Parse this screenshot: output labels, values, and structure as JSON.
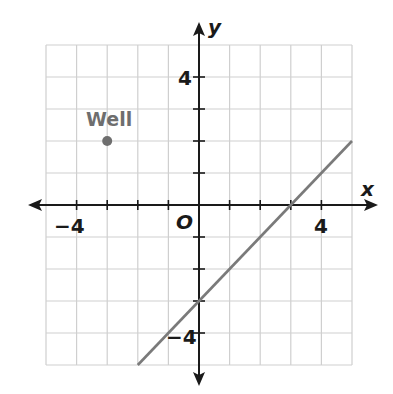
{
  "chart_data": {
    "type": "line",
    "title": "",
    "xlabel": "x",
    "ylabel": "y",
    "xlim": [
      -5,
      5
    ],
    "ylim": [
      -5,
      5
    ],
    "grid": true,
    "x_tick_labels": [
      {
        "value": -4,
        "label": "−4"
      },
      {
        "value": 4,
        "label": "4"
      }
    ],
    "y_tick_labels": [
      {
        "value": 4,
        "label": "4"
      },
      {
        "value": -4,
        "label": "−4"
      }
    ],
    "origin_label": "O",
    "series": [
      {
        "name": "line",
        "type": "line",
        "equation": "y = x - 3",
        "points": [
          [
            -2,
            -5
          ],
          [
            5,
            2
          ]
        ],
        "color": "#7a7a7a"
      }
    ],
    "points": [
      {
        "label": "Well",
        "x": -3,
        "y": 2,
        "color": "#6e6e6e"
      }
    ]
  },
  "labels": {
    "x_axis": "x",
    "y_axis": "y",
    "origin": "O",
    "x_neg4": "−4",
    "x_pos4": "4",
    "y_pos4": "4",
    "y_neg4": "−4",
    "point_well": "Well"
  },
  "colors": {
    "grid": "#cfcfcf",
    "axis": "#1a1a1a",
    "line": "#7a7a7a",
    "point": "#6e6e6e"
  }
}
